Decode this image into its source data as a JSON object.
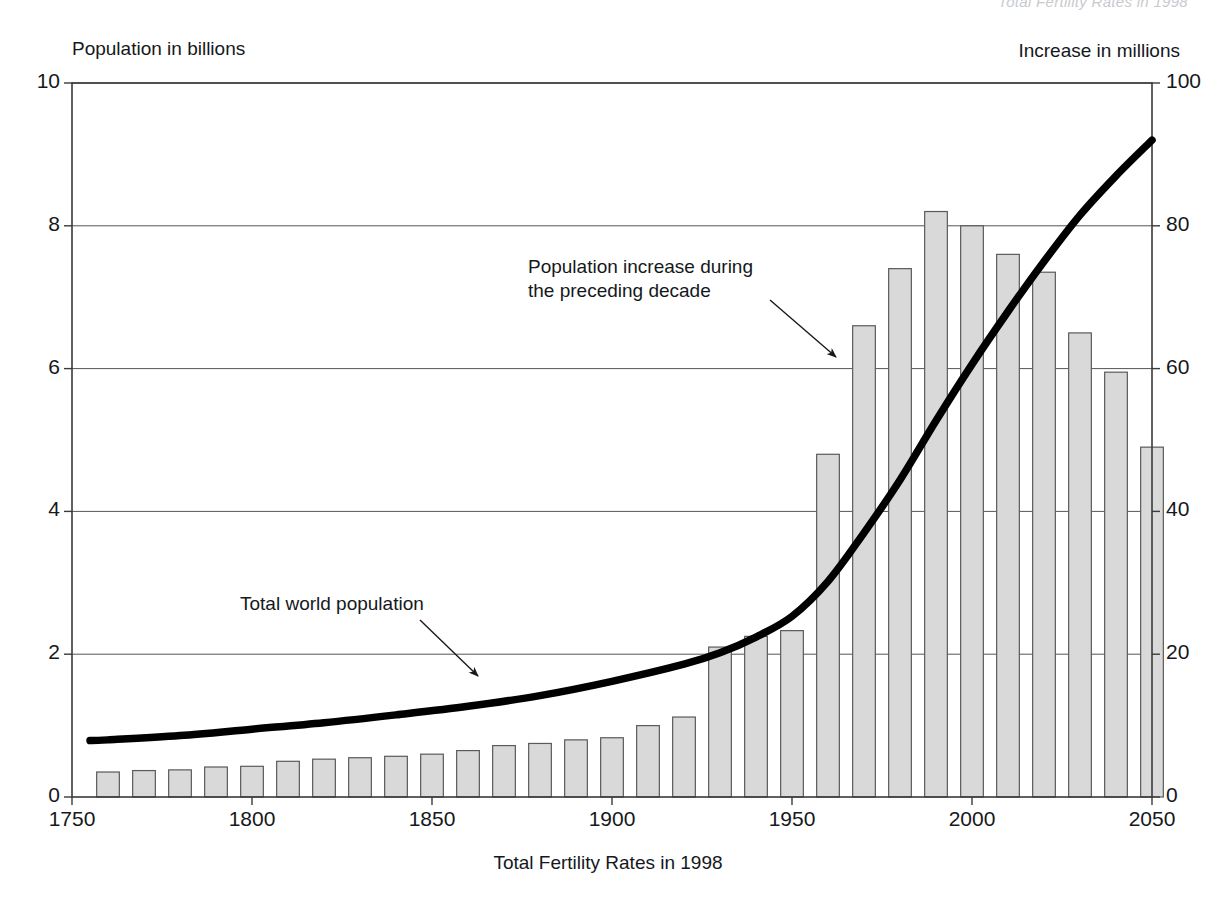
{
  "figure": {
    "clipped_header_text": "Total Fertility Rates in 1998",
    "left_axis_title": "Population in billions",
    "right_axis_title": "Increase in millions",
    "x_axis_title": "Total Fertility Rates in 1998",
    "annotation_bars": "Population increase during\nthe preceding decade",
    "annotation_curve": "Total world population"
  },
  "colors": {
    "bar_fill": "#d9d9d9",
    "bar_stroke": "#5a5a5a",
    "line": "#000000",
    "grid": "#555555",
    "frame": "#3a3a3a",
    "text": "#15181c"
  },
  "chart_data": {
    "type": "bar",
    "title": "",
    "subtitle": "",
    "xlabel": "Total Fertility Rates in 1998",
    "ylabel": "Population in billions",
    "y2label": "Increase in millions",
    "xlim": [
      1750,
      2050
    ],
    "ylim": [
      0,
      10
    ],
    "y2lim": [
      0,
      100
    ],
    "xticks": [
      1750,
      1800,
      1850,
      1900,
      1950,
      2000,
      2050
    ],
    "xtick_labels": [
      "1750",
      "1800",
      "1850",
      "1900",
      "1950",
      "2000",
      "2050"
    ],
    "yticks": [
      0,
      2,
      4,
      6,
      8,
      10
    ],
    "ytick_labels": [
      "0",
      "2",
      "4",
      "6",
      "8",
      "10"
    ],
    "y2ticks": [
      0,
      20,
      40,
      60,
      80,
      100
    ],
    "y2tick_labels": [
      "0",
      "20",
      "40",
      "60",
      "80",
      "100"
    ],
    "grid": "horizontal",
    "legend": "annotations",
    "series": [
      {
        "name": "Population increase during the preceding decade",
        "type": "bar",
        "axis": "right",
        "unit": "millions",
        "categories": [
          1760,
          1770,
          1780,
          1790,
          1800,
          1810,
          1820,
          1830,
          1840,
          1850,
          1860,
          1870,
          1880,
          1890,
          1900,
          1910,
          1920,
          1930,
          1940,
          1950,
          1960,
          1970,
          1980,
          1990,
          2000,
          2010,
          2020,
          2030,
          2040,
          2050
        ],
        "values": [
          3.5,
          3.7,
          3.8,
          4.2,
          4.3,
          5.0,
          5.3,
          5.5,
          5.7,
          6.0,
          6.5,
          7.2,
          7.5,
          8.0,
          8.3,
          10.0,
          11.2,
          21.0,
          22.5,
          23.3,
          48.0,
          66.0,
          74.0,
          82.0,
          80.0,
          76.0,
          73.5,
          65.0,
          59.5,
          49.0
        ]
      },
      {
        "name": "Total world population",
        "type": "line",
        "axis": "left",
        "unit": "billions",
        "x": [
          1755,
          1760,
          1780,
          1800,
          1820,
          1840,
          1860,
          1880,
          1900,
          1920,
          1930,
          1940,
          1950,
          1960,
          1970,
          1980,
          1990,
          2000,
          2010,
          2020,
          2030,
          2040,
          2050
        ],
        "values": [
          0.79,
          0.8,
          0.86,
          0.95,
          1.04,
          1.15,
          1.27,
          1.42,
          1.62,
          1.86,
          2.02,
          2.24,
          2.53,
          3.02,
          3.7,
          4.44,
          5.27,
          6.06,
          6.8,
          7.5,
          8.15,
          8.7,
          9.2
        ]
      }
    ]
  }
}
